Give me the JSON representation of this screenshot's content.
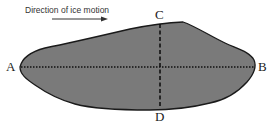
{
  "diagram": {
    "caption": "Direction of ice motion",
    "labels": {
      "a": "A",
      "b": "B",
      "c": "C",
      "d": "D"
    },
    "colors": {
      "fill": "#7a7a7a",
      "outline": "#1a1a1a",
      "axis": "#111111"
    },
    "axes": [
      {
        "name": "long-axis",
        "from": "A",
        "to": "B",
        "style": "dotted"
      },
      {
        "name": "short-axis",
        "from": "C",
        "to": "D",
        "style": "dashed"
      }
    ]
  }
}
